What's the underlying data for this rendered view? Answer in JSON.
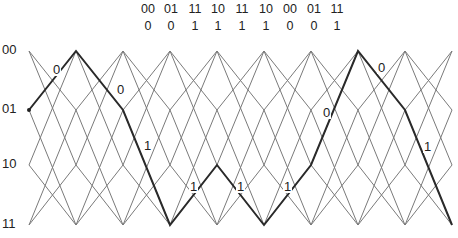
{
  "header": {
    "columns": [
      {
        "code": "00",
        "bit": "0",
        "x": 148
      },
      {
        "code": "01",
        "bit": "0",
        "x": 171
      },
      {
        "code": "11",
        "bit": "1",
        "x": 195
      },
      {
        "code": "10",
        "bit": "1",
        "x": 218
      },
      {
        "code": "11",
        "bit": "1",
        "x": 242
      },
      {
        "code": "10",
        "bit": "1",
        "x": 266
      },
      {
        "code": "00",
        "bit": "0",
        "x": 290
      },
      {
        "code": "01",
        "bit": "0",
        "x": 314
      },
      {
        "code": "11",
        "bit": "1",
        "x": 337
      }
    ]
  },
  "states": [
    {
      "label": "00",
      "y": 51
    },
    {
      "label": "01",
      "y": 110
    },
    {
      "label": "10",
      "y": 165
    },
    {
      "label": "11",
      "y": 225
    }
  ],
  "columns_x": [
    29,
    76,
    123,
    170,
    217,
    264,
    311,
    358,
    405,
    452
  ],
  "transitions": {
    "00": [
      "01",
      "10"
    ],
    "01": [
      "00",
      "11"
    ],
    "10": [
      "00",
      "11"
    ],
    "11": [
      "01",
      "10"
    ]
  },
  "path": {
    "states": [
      "01",
      "00",
      "01",
      "11",
      "10",
      "11",
      "10",
      "00",
      "01",
      "11"
    ],
    "labels": [
      {
        "text": "0",
        "x": 52,
        "y": 63
      },
      {
        "text": "0",
        "x": 116,
        "y": 83
      },
      {
        "text": "1",
        "x": 143,
        "y": 139
      },
      {
        "text": "1",
        "x": 189,
        "y": 180
      },
      {
        "text": "1",
        "x": 236,
        "y": 180
      },
      {
        "text": "1",
        "x": 283,
        "y": 180
      },
      {
        "text": "0",
        "x": 322,
        "y": 106
      },
      {
        "text": "0",
        "x": 377,
        "y": 61
      },
      {
        "text": "1",
        "x": 423,
        "y": 140
      }
    ]
  },
  "colors": {
    "line": "#7a7a7a",
    "path": "#2a2a2a",
    "text": "#222222"
  }
}
